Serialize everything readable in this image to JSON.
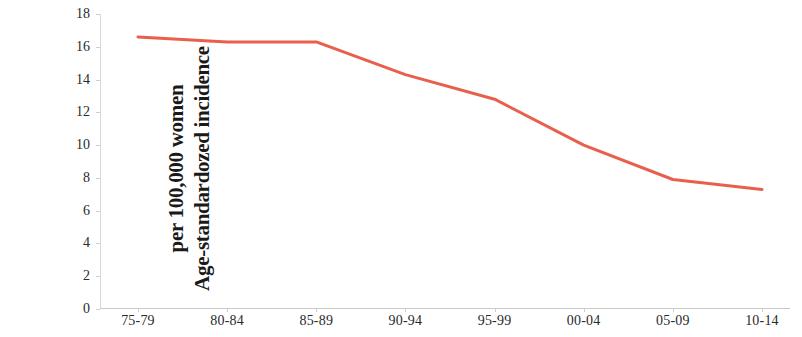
{
  "chart_data": {
    "type": "line",
    "title": "",
    "xlabel": "",
    "ylabel": "Age-standardozed incidence per 100,000 women",
    "ylabel_lines": [
      "Age-standardozed incidence",
      "per 100,000 women"
    ],
    "categories": [
      "75-79",
      "80-84",
      "85-89",
      "90-94",
      "95-99",
      "00-04",
      "05-09",
      "10-14"
    ],
    "values": [
      16.6,
      16.3,
      16.3,
      14.3,
      12.8,
      10.0,
      7.9,
      7.3
    ],
    "series": [
      {
        "name": "Age-standardozed incidence",
        "values": [
          16.6,
          16.3,
          16.3,
          14.3,
          12.8,
          10.0,
          7.9,
          7.3
        ],
        "color": "#e8604c"
      }
    ],
    "ylim": [
      0,
      18
    ],
    "ytick_labels": [
      "0",
      "2",
      "4",
      "6",
      "8",
      "10",
      "12",
      "14",
      "16",
      "18"
    ],
    "ytick_values": [
      0,
      2,
      4,
      6,
      8,
      10,
      12,
      14,
      16,
      18
    ],
    "grid": false,
    "legend": "none",
    "line_color": "#e8604c",
    "axis_color": "#cfcfcf",
    "background_color": "#ffffff",
    "markers": false
  }
}
